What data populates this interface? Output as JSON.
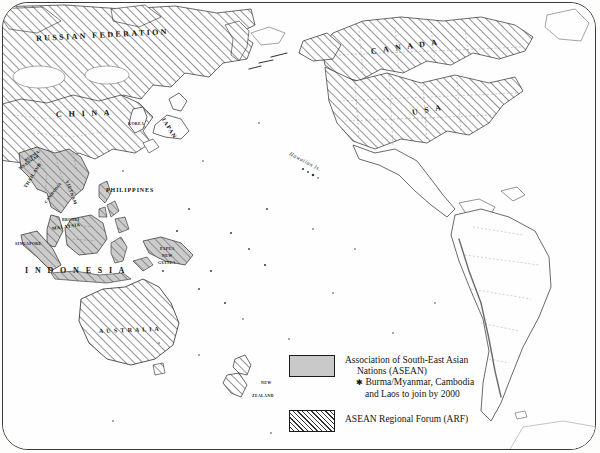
{
  "map": {
    "title": "ASEAN and ASEAN Regional Forum member states, Asia-Pacific",
    "projection_note": "Pacific-centred world map",
    "ocean_color": "#fefefe",
    "asean_fill": "#c9c9c9",
    "arf_hatch_color": "#333333",
    "border_color": "#3a3a3a",
    "labels": [
      {
        "id": "russian-federation",
        "text": "RUSSIAN FEDERATION",
        "x": 33,
        "y": 31,
        "size": "country",
        "rotate": -3,
        "fill": "arf"
      },
      {
        "id": "canada",
        "text": "C A N A D A",
        "x": 368,
        "y": 44,
        "size": "country",
        "rotate": -8,
        "fill": "arf"
      },
      {
        "id": "china",
        "text": "C H I N A",
        "x": 53,
        "y": 107,
        "size": "country",
        "rotate": -2,
        "fill": "arf"
      },
      {
        "id": "usa",
        "text": "U S A",
        "x": 409,
        "y": 105,
        "size": "country",
        "rotate": -10,
        "fill": "arf"
      },
      {
        "id": "japan",
        "text": "JAPAN",
        "x": 160,
        "y": 112,
        "size": "country sm",
        "rotate": 58,
        "fill": "none"
      },
      {
        "id": "korea",
        "text": "KOREA",
        "x": 125,
        "y": 118,
        "size": "country tiny",
        "rotate": 0,
        "fill": "none"
      },
      {
        "id": "hawaiian-is",
        "text": "Hawaiian Is.",
        "x": 287,
        "y": 147,
        "size": "ital",
        "rotate": 28,
        "fill": "none"
      },
      {
        "id": "burma-myanmar",
        "text": "BURMA/",
        "x": 22,
        "y": 155,
        "size": "country tiny",
        "rotate": -34,
        "fill": "asean-star"
      },
      {
        "id": "myanmar",
        "text": "MYANMAR",
        "x": 16,
        "y": 163,
        "size": "country tiny",
        "rotate": -34,
        "fill": "asean-star"
      },
      {
        "id": "thailand",
        "text": "THAILAND",
        "x": 22,
        "y": 182,
        "size": "country xs",
        "rotate": -58,
        "fill": "asean"
      },
      {
        "id": "cambodia",
        "text": "CAMBODIA",
        "x": 42,
        "y": 197,
        "size": "country tiny",
        "rotate": -52,
        "fill": "asean-star"
      },
      {
        "id": "vietnam",
        "text": "VIETNAM",
        "x": 64,
        "y": 175,
        "size": "country xs",
        "rotate": 70,
        "fill": "asean"
      },
      {
        "id": "philippines",
        "text": "PHILIPPINES",
        "x": 103,
        "y": 184,
        "size": "country sm",
        "rotate": 0,
        "fill": "asean"
      },
      {
        "id": "brunei",
        "text": "BRUNEI",
        "x": 59,
        "y": 214,
        "size": "country tiny",
        "rotate": 0,
        "fill": "asean"
      },
      {
        "id": "malaysia",
        "text": "MALAYSIA",
        "x": 49,
        "y": 223,
        "size": "country xs",
        "rotate": -8,
        "fill": "asean"
      },
      {
        "id": "singapore",
        "text": "SINGAPORE",
        "x": 12,
        "y": 238,
        "size": "country tiny",
        "rotate": 0,
        "fill": "asean"
      },
      {
        "id": "indonesia",
        "text": "I N D O N E S I A",
        "x": 22,
        "y": 263,
        "size": "country",
        "rotate": 0,
        "fill": "asean"
      },
      {
        "id": "papua-new-guinea-1",
        "text": "PAPUA",
        "x": 157,
        "y": 243,
        "size": "country tiny",
        "rotate": 0,
        "fill": "asean"
      },
      {
        "id": "papua-new-guinea-2",
        "text": "NEW",
        "x": 159,
        "y": 250,
        "size": "country tiny",
        "rotate": 0,
        "fill": "asean"
      },
      {
        "id": "papua-new-guinea-3",
        "text": "GUINEA",
        "x": 155,
        "y": 257,
        "size": "country tiny",
        "rotate": 0,
        "fill": "asean"
      },
      {
        "id": "australia",
        "text": "A U S T R A L I A",
        "x": 96,
        "y": 325,
        "size": "country sm",
        "rotate": -2,
        "fill": "arf"
      },
      {
        "id": "new-zealand-1",
        "text": "NEW",
        "x": 258,
        "y": 377,
        "size": "country tiny",
        "rotate": 0,
        "fill": "arf"
      },
      {
        "id": "new-zealand-2",
        "text": "ZEALAND",
        "x": 249,
        "y": 390,
        "size": "country tiny",
        "rotate": 0,
        "fill": "arf"
      }
    ]
  },
  "legend": {
    "asean": {
      "swatch": "solid-grey-swatch",
      "line1": "Association of South-East Asian",
      "line2": "Nations (ASEAN)",
      "star": "✱",
      "note1": "Burma/Myanmar, Cambodia",
      "note2": "and Laos to join by 2000"
    },
    "arf": {
      "swatch": "diagonal-hatch-swatch",
      "label": "ASEAN Regional Forum (ARF)"
    }
  }
}
